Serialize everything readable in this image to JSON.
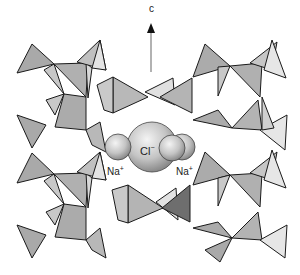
{
  "figure": {
    "axis": {
      "label": "c"
    },
    "ions": {
      "central": {
        "symbol": "Cl",
        "charge": "−"
      },
      "left": {
        "symbol": "Na",
        "charge": "+"
      },
      "right": {
        "symbol": "Na",
        "charge": "+"
      }
    },
    "colors": {
      "tetra_dark": "#a9a9a9",
      "tetra_mid": "#c2c2c2",
      "tetra_light": "#e4e4e4",
      "tetra_darkest": "#6e6e6e",
      "edge": "#1a1a1a",
      "sphere": "#c8c8c8",
      "axis": "#999999"
    }
  }
}
